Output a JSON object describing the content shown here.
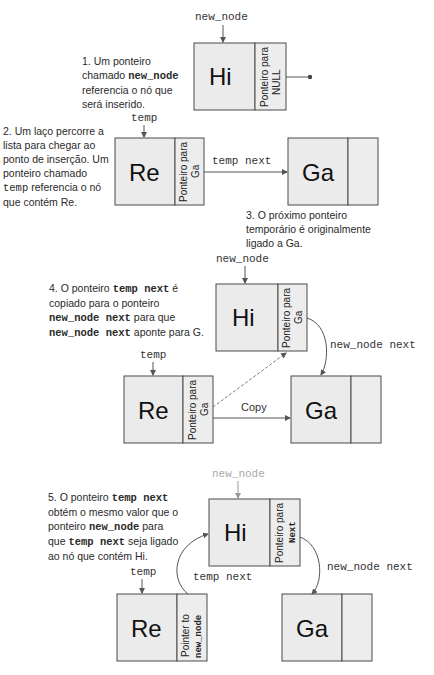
{
  "steps": [
    {
      "id": 1,
      "note": {
        "prefix": "1. Um ponteiro",
        "line2_a": "chamado ",
        "line2_code": "new_node",
        "line3": "referencia o nó que",
        "line4": "será inserido."
      },
      "pointer_label": "new_node",
      "node": {
        "value": "Hi",
        "ptr_line1": "Ponteiro para",
        "ptr_line2": "NULL"
      }
    },
    {
      "id": 2,
      "note": {
        "line1": "2. Um laço percorre a",
        "line2": "lista para chegar ao",
        "line3": "ponto de inserção. Um",
        "line4": "ponteiro chamado",
        "line5_code": "temp",
        "line5_b": " referencia o nó",
        "line6": "que contém Re."
      },
      "pointer_label": "temp",
      "node_a": {
        "value": "Re",
        "ptr_line1": "Ponteiro para",
        "ptr_line2": "Ga"
      },
      "arrow_label": "temp next",
      "node_b": {
        "value": "Ga"
      }
    },
    {
      "id": 3,
      "note": {
        "line1": "3. O próximo ponteiro",
        "line2": "temporário é originalmente",
        "line3": "ligado a Ga."
      }
    },
    {
      "id": 4,
      "note": {
        "l1_a": "4. O ponteiro ",
        "l1_code": "temp next",
        "l1_b": " é",
        "line2": "copiado para o ponteiro",
        "l3_code": "new_node next",
        "l3_b": " para que",
        "l4_code": "new_node next",
        "l4_b": " aponte para G."
      },
      "pointer_label_top": "new_node",
      "node_new": {
        "value": "Hi",
        "ptr_line1": "Ponteiro para",
        "ptr_line2": "Ga"
      },
      "curve_label": "new_node next",
      "pointer_label_temp": "temp",
      "node_a": {
        "value": "Re",
        "ptr_line1": "Ponteiro para",
        "ptr_line2": "Ga"
      },
      "copy_label": "Copy",
      "node_b": {
        "value": "Ga"
      }
    },
    {
      "id": 5,
      "note": {
        "l1_a": "5. O ponteiro ",
        "l1_code": "temp next",
        "line2": "obtém o mesmo valor que o",
        "l3_a": "ponteiro ",
        "l3_code": "new_node",
        "l3_b": " para",
        "l4_a": "que ",
        "l4_code": "temp next",
        "l4_b": " seja ligado",
        "line5": "ao nó que contém Hi."
      },
      "pointer_label_top": "new_node",
      "node_new": {
        "value": "Hi",
        "ptr_line1": "Ponteiro para",
        "ptr_line2": "Next"
      },
      "curve_label_right": "new_node next",
      "curve_label_left": "temp next",
      "pointer_label_temp": "temp",
      "node_a": {
        "value": "Re",
        "ptr_line1": "Pointer to",
        "ptr_line2": "new_node"
      },
      "node_b": {
        "value": "Ga"
      }
    }
  ]
}
